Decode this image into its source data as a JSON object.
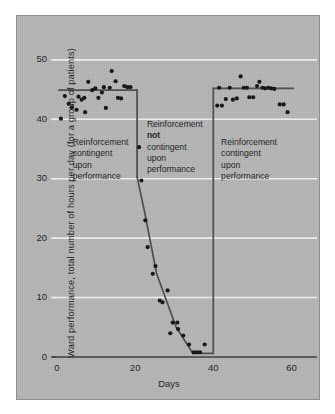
{
  "figure": {
    "background_color": "#ffffff",
    "panel_color": "#b5b5b5",
    "panel_border_color": "#8d8d8d",
    "ink_color": "#1b1b1b",
    "gridline_color": "#f2f2f2"
  },
  "chart_data": {
    "type": "scatter",
    "title": "",
    "subtitle": "",
    "xlabel": "Days",
    "ylabel": "Ward performance, total number of hours per day (for a group of patients)",
    "xlim": [
      0,
      65
    ],
    "ylim": [
      0,
      53
    ],
    "xticks": [
      0,
      20,
      40,
      60
    ],
    "xticklabels": [
      "0",
      "20",
      "40",
      "60"
    ],
    "yticks": [
      0,
      10,
      20,
      30,
      40,
      50
    ],
    "yticklabels": [
      "0",
      "10",
      "20",
      "30",
      "40",
      "50"
    ],
    "grid": "horizontal-white-gridlines",
    "legend": "none",
    "series": [
      {
        "name": "Ward performance",
        "marker": "filled-circle",
        "marker_color": "#111111",
        "points": [
          [
            1,
            40.1
          ],
          [
            2,
            43.9
          ],
          [
            3,
            42.6
          ],
          [
            3.8,
            42.0
          ],
          [
            5,
            41.6
          ],
          [
            5.5,
            43.8
          ],
          [
            6.3,
            43.3
          ],
          [
            7,
            43.6
          ],
          [
            7.2,
            41.2
          ],
          [
            8,
            46.3
          ],
          [
            9,
            44.9
          ],
          [
            9.8,
            45.2
          ],
          [
            10.6,
            43.6
          ],
          [
            11.5,
            44.5
          ],
          [
            12,
            45.4
          ],
          [
            12.5,
            41.9
          ],
          [
            13.5,
            45.3
          ],
          [
            14,
            48.1
          ],
          [
            15,
            46.4
          ],
          [
            15.6,
            43.6
          ],
          [
            16.4,
            43.5
          ],
          [
            17.2,
            45.6
          ],
          [
            18,
            45.4
          ],
          [
            18.8,
            45.4
          ],
          [
            21,
            35.3
          ],
          [
            21.6,
            29.7
          ],
          [
            22.6,
            23.0
          ],
          [
            23.2,
            18.5
          ],
          [
            24.5,
            14.0
          ],
          [
            25.2,
            15.3
          ],
          [
            26.3,
            9.5
          ],
          [
            27.0,
            9.2
          ],
          [
            28.3,
            11.2
          ],
          [
            29.0,
            4.0
          ],
          [
            29.6,
            5.8
          ],
          [
            30.8,
            5.8
          ],
          [
            31.0,
            4.7
          ],
          [
            32.3,
            3.6
          ],
          [
            33.8,
            2.1
          ],
          [
            35.0,
            0.8
          ],
          [
            35.8,
            0.8
          ],
          [
            36.6,
            0.8
          ],
          [
            37.8,
            2.1
          ],
          [
            41.0,
            42.3
          ],
          [
            41.5,
            45.3
          ],
          [
            42.2,
            42.3
          ],
          [
            43.2,
            43.4
          ],
          [
            44.2,
            45.3
          ],
          [
            45.0,
            43.3
          ],
          [
            46.0,
            43.5
          ],
          [
            47.0,
            47.2
          ],
          [
            47.8,
            45.3
          ],
          [
            48.6,
            45.3
          ],
          [
            49.2,
            43.7
          ],
          [
            50.2,
            43.7
          ],
          [
            51.2,
            45.6
          ],
          [
            51.8,
            46.3
          ],
          [
            52.6,
            45.3
          ],
          [
            53.3,
            45.2
          ],
          [
            54.1,
            45.3
          ],
          [
            54.8,
            45.2
          ],
          [
            55.6,
            45.1
          ],
          [
            57.0,
            42.5
          ],
          [
            58.0,
            42.5
          ],
          [
            59.0,
            41.2
          ]
        ]
      }
    ],
    "trend_lines": [
      {
        "name": "phase-1-baseline",
        "description": "Horizontal reference line near 45 hours during first contingent-reinforcement phase",
        "points": [
          [
            0.5,
            44.9
          ],
          [
            20.5,
            44.9
          ]
        ]
      },
      {
        "name": "phase-1-drop",
        "description": "Vertical drop at day 20.5 from 45 down to 30",
        "points": [
          [
            20.5,
            44.9
          ],
          [
            20.5,
            30.3
          ]
        ]
      },
      {
        "name": "extinction-decline",
        "description": "Declining trend during non-contingent reinforcement phase",
        "points": [
          [
            20.5,
            30.3
          ],
          [
            22.6,
            23.8
          ],
          [
            25.5,
            14.0
          ],
          [
            30.5,
            5.0
          ],
          [
            34.8,
            0.6
          ]
        ]
      },
      {
        "name": "phase-2-floor",
        "description": "Floor at zero hours from day 34.8 to day 40",
        "points": [
          [
            34.8,
            0.6
          ],
          [
            40.0,
            0.6
          ]
        ]
      },
      {
        "name": "phase-3-recovery",
        "description": "Vertical recovery at day 40 back to 45 hours",
        "points": [
          [
            40.0,
            0.6
          ],
          [
            40.0,
            45.2
          ]
        ]
      },
      {
        "name": "phase-3-baseline",
        "description": "Horizontal reference line near 45 hours during reinstated contingent reinforcement",
        "points": [
          [
            40.0,
            45.2
          ],
          [
            60.5,
            45.2
          ]
        ]
      }
    ],
    "annotations": [
      {
        "name": "phase-1-label",
        "x_day": 4,
        "y_value": 37,
        "lines": [
          "Reinforcement",
          "contingent",
          "upon",
          "performance"
        ],
        "bold_line_index": -1
      },
      {
        "name": "phase-2-label",
        "x_day": 23,
        "y_value": 40,
        "lines": [
          "Reinforcement",
          "not",
          "contingent",
          "upon",
          "performance"
        ],
        "bold_line_index": 1
      },
      {
        "name": "phase-3-label",
        "x_day": 42,
        "y_value": 37,
        "lines": [
          "Reinforcement",
          "contingent",
          "upon",
          "performance"
        ],
        "bold_line_index": -1
      }
    ]
  }
}
